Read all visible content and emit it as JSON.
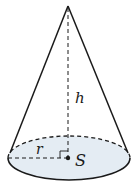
{
  "figure": {
    "type": "cone",
    "labels": {
      "height": "h",
      "radius": "r",
      "center": "S"
    },
    "colors": {
      "stroke": "#1a1a1a",
      "base_fill": "#e4ecf3",
      "background": "#ffffff"
    }
  }
}
